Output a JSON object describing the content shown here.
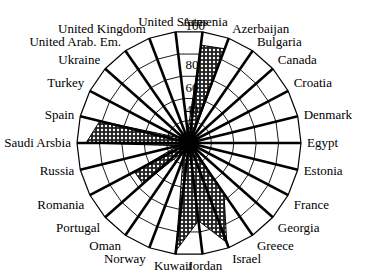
{
  "chart_data": {
    "type": "radar",
    "title": "",
    "categories": [
      "Armenia",
      "Azerbaijan",
      "Bulgaria",
      "Canada",
      "Croatia",
      "Denmark",
      "Egypt",
      "Estonia",
      "France",
      "Georgia",
      "Greece",
      "Israel",
      "Jordan",
      "Kuwait",
      "Norway",
      "Oman",
      "Portugal",
      "Romania",
      "Russia",
      "Saudi Arsbia",
      "Spain",
      "Turkey",
      "Ukraine",
      "United Arab. Em.",
      "United Kingdom",
      "United States"
    ],
    "values": [
      88,
      90,
      5,
      5,
      5,
      5,
      5,
      5,
      5,
      5,
      55,
      95,
      70,
      97,
      15,
      10,
      55,
      55,
      10,
      92,
      82,
      10,
      10,
      10,
      10,
      10
    ],
    "ticks": [
      40,
      60,
      80,
      100
    ],
    "rings": [
      20,
      40,
      60,
      80,
      100
    ],
    "ylim": [
      0,
      100
    ],
    "grid": true,
    "legend": "none"
  },
  "colors": {
    "line": "#000000",
    "fill_pattern": "#555555",
    "background": "#ffffff"
  }
}
